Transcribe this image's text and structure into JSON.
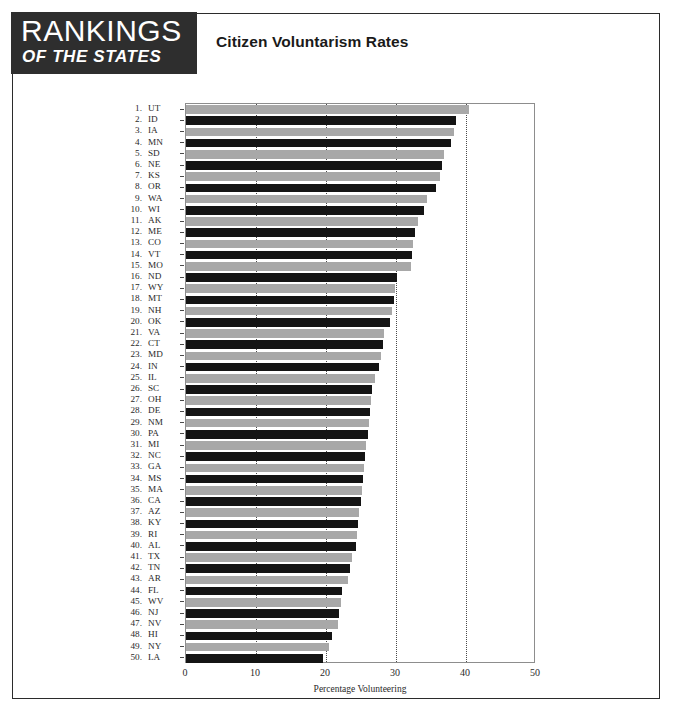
{
  "masthead": {
    "line1": "RANKINGS",
    "line2": "OF THE STATES",
    "background": "#2e2e2e",
    "text_color": "#ffffff"
  },
  "header": {
    "title": "Citizen Voluntarism Rates"
  },
  "chart_data": {
    "type": "bar",
    "orientation": "horizontal",
    "title": "Citizen Voluntarism Rates",
    "xlabel": "Percentage Volunteering",
    "ylabel": "",
    "xlim": [
      0,
      50
    ],
    "xticks": [
      0,
      10,
      20,
      30,
      40,
      50
    ],
    "gridlines": [
      10,
      20,
      30,
      40
    ],
    "grid": true,
    "legend": null,
    "bar_colors": {
      "odd_rank": "#a8a8a8",
      "even_rank": "#141414"
    },
    "categories": [
      "UT",
      "ID",
      "IA",
      "MN",
      "SD",
      "NE",
      "KS",
      "OR",
      "WA",
      "WI",
      "AK",
      "ME",
      "CO",
      "VT",
      "MO",
      "ND",
      "WY",
      "MT",
      "NH",
      "OK",
      "VA",
      "CT",
      "MD",
      "IN",
      "IL",
      "SC",
      "OH",
      "DE",
      "NM",
      "PA",
      "MI",
      "NC",
      "GA",
      "MS",
      "MA",
      "CA",
      "AZ",
      "KY",
      "RI",
      "AL",
      "TX",
      "TN",
      "AR",
      "FL",
      "WV",
      "NJ",
      "NV",
      "HI",
      "NY",
      "LA"
    ],
    "ranks": [
      1,
      2,
      3,
      4,
      5,
      6,
      7,
      8,
      9,
      10,
      11,
      12,
      13,
      14,
      15,
      16,
      17,
      18,
      19,
      20,
      21,
      22,
      23,
      24,
      25,
      26,
      27,
      28,
      29,
      30,
      31,
      32,
      33,
      34,
      35,
      36,
      37,
      38,
      39,
      40,
      41,
      42,
      43,
      44,
      45,
      46,
      47,
      48,
      49,
      50
    ],
    "values": [
      40.4,
      38.6,
      38.3,
      37.9,
      36.9,
      36.6,
      36.3,
      35.7,
      34.4,
      34.0,
      33.1,
      32.7,
      32.4,
      32.3,
      32.1,
      30.1,
      29.9,
      29.7,
      29.4,
      29.1,
      28.3,
      28.1,
      27.9,
      27.6,
      27.0,
      26.6,
      26.4,
      26.3,
      26.1,
      26.0,
      25.7,
      25.6,
      25.4,
      25.3,
      25.1,
      25.0,
      24.7,
      24.6,
      24.4,
      24.3,
      23.7,
      23.4,
      23.1,
      22.3,
      22.1,
      21.9,
      21.7,
      20.9,
      20.4,
      19.6
    ],
    "rows": [
      {
        "rank": 1,
        "abbr": "UT",
        "value": 40.4
      },
      {
        "rank": 2,
        "abbr": "ID",
        "value": 38.6
      },
      {
        "rank": 3,
        "abbr": "IA",
        "value": 38.3
      },
      {
        "rank": 4,
        "abbr": "MN",
        "value": 37.9
      },
      {
        "rank": 5,
        "abbr": "SD",
        "value": 36.9
      },
      {
        "rank": 6,
        "abbr": "NE",
        "value": 36.6
      },
      {
        "rank": 7,
        "abbr": "KS",
        "value": 36.3
      },
      {
        "rank": 8,
        "abbr": "OR",
        "value": 35.7
      },
      {
        "rank": 9,
        "abbr": "WA",
        "value": 34.4
      },
      {
        "rank": 10,
        "abbr": "WI",
        "value": 34.0
      },
      {
        "rank": 11,
        "abbr": "AK",
        "value": 33.1
      },
      {
        "rank": 12,
        "abbr": "ME",
        "value": 32.7
      },
      {
        "rank": 13,
        "abbr": "CO",
        "value": 32.4
      },
      {
        "rank": 14,
        "abbr": "VT",
        "value": 32.3
      },
      {
        "rank": 15,
        "abbr": "MO",
        "value": 32.1
      },
      {
        "rank": 16,
        "abbr": "ND",
        "value": 30.1
      },
      {
        "rank": 17,
        "abbr": "WY",
        "value": 29.9
      },
      {
        "rank": 18,
        "abbr": "MT",
        "value": 29.7
      },
      {
        "rank": 19,
        "abbr": "NH",
        "value": 29.4
      },
      {
        "rank": 20,
        "abbr": "OK",
        "value": 29.1
      },
      {
        "rank": 21,
        "abbr": "VA",
        "value": 28.3
      },
      {
        "rank": 22,
        "abbr": "CT",
        "value": 28.1
      },
      {
        "rank": 23,
        "abbr": "MD",
        "value": 27.9
      },
      {
        "rank": 24,
        "abbr": "IN",
        "value": 27.6
      },
      {
        "rank": 25,
        "abbr": "IL",
        "value": 27.0
      },
      {
        "rank": 26,
        "abbr": "SC",
        "value": 26.6
      },
      {
        "rank": 27,
        "abbr": "OH",
        "value": 26.4
      },
      {
        "rank": 28,
        "abbr": "DE",
        "value": 26.3
      },
      {
        "rank": 29,
        "abbr": "NM",
        "value": 26.1
      },
      {
        "rank": 30,
        "abbr": "PA",
        "value": 26.0
      },
      {
        "rank": 31,
        "abbr": "MI",
        "value": 25.7
      },
      {
        "rank": 32,
        "abbr": "NC",
        "value": 25.6
      },
      {
        "rank": 33,
        "abbr": "GA",
        "value": 25.4
      },
      {
        "rank": 34,
        "abbr": "MS",
        "value": 25.3
      },
      {
        "rank": 35,
        "abbr": "MA",
        "value": 25.1
      },
      {
        "rank": 36,
        "abbr": "CA",
        "value": 25.0
      },
      {
        "rank": 37,
        "abbr": "AZ",
        "value": 24.7
      },
      {
        "rank": 38,
        "abbr": "KY",
        "value": 24.6
      },
      {
        "rank": 39,
        "abbr": "RI",
        "value": 24.4
      },
      {
        "rank": 40,
        "abbr": "AL",
        "value": 24.3
      },
      {
        "rank": 41,
        "abbr": "TX",
        "value": 23.7
      },
      {
        "rank": 42,
        "abbr": "TN",
        "value": 23.4
      },
      {
        "rank": 43,
        "abbr": "AR",
        "value": 23.1
      },
      {
        "rank": 44,
        "abbr": "FL",
        "value": 22.3
      },
      {
        "rank": 45,
        "abbr": "WV",
        "value": 22.1
      },
      {
        "rank": 46,
        "abbr": "NJ",
        "value": 21.9
      },
      {
        "rank": 47,
        "abbr": "NV",
        "value": 21.7
      },
      {
        "rank": 48,
        "abbr": "HI",
        "value": 20.9
      },
      {
        "rank": 49,
        "abbr": "NY",
        "value": 20.4
      },
      {
        "rank": 50,
        "abbr": "LA",
        "value": 19.6
      }
    ]
  }
}
